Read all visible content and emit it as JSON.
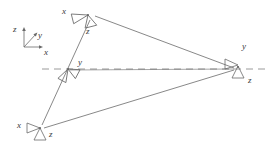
{
  "figure": {
    "type": "camera-network-diagram",
    "width": 268,
    "height": 145,
    "background_color": "#ffffff",
    "line_color": "#5a5a5a",
    "dashed_line_color": "#9a9a9a",
    "text_color": "#3a3a3a"
  },
  "world_frame": {
    "name": "world-coordinate-frame",
    "origin": {
      "x": 24,
      "y": 47
    },
    "axes": [
      {
        "id": "z",
        "label": "z",
        "label_x": 14,
        "label_y": 28,
        "tip_x": 24,
        "tip_y": 29
      },
      {
        "id": "y",
        "label": "y",
        "label_x": 38,
        "label_y": 35,
        "tip_x": 36,
        "tip_y": 34
      },
      {
        "id": "x",
        "label": "x",
        "label_x": 44,
        "label_y": 50,
        "tip_x": 42,
        "tip_y": 47
      }
    ]
  },
  "baseline": {
    "name": "horizontal-dashed-axis",
    "y": 69,
    "x_start": 42,
    "x_end": 268,
    "dash": "7 5"
  },
  "cameras": [
    {
      "id": "camera-top",
      "x": 88,
      "y": 15,
      "rotation": -14,
      "labels": [
        {
          "axis": "x",
          "text": "x",
          "lx": 62,
          "ly": 10
        },
        {
          "axis": "z",
          "text": "z",
          "lx": 88,
          "ly": 29
        }
      ]
    },
    {
      "id": "camera-middle",
      "x": 68,
      "y": 69,
      "rotation": -60,
      "labels": [
        {
          "axis": "y",
          "text": "y",
          "lx": 78,
          "ly": 60
        }
      ]
    },
    {
      "id": "camera-bottom-left",
      "x": 40,
      "y": 128,
      "rotation": 0,
      "labels": [
        {
          "axis": "x",
          "text": "x",
          "lx": 18,
          "ly": 124
        },
        {
          "axis": "z",
          "text": "z",
          "lx": 50,
          "ly": 132
        }
      ]
    },
    {
      "id": "camera-right",
      "x": 238,
      "y": 69,
      "rotation": 0,
      "labels": [
        {
          "axis": "y",
          "text": "y",
          "lx": 243,
          "ly": 46
        },
        {
          "axis": "z",
          "text": "z",
          "lx": 248,
          "ly": 79
        }
      ]
    }
  ],
  "connections": [
    {
      "from": "camera-top",
      "to": "camera-right"
    },
    {
      "from": "camera-top",
      "to": "camera-bottom-left"
    },
    {
      "from": "camera-bottom-left",
      "to": "camera-right"
    },
    {
      "from": "camera-middle",
      "to": "camera-right"
    }
  ]
}
